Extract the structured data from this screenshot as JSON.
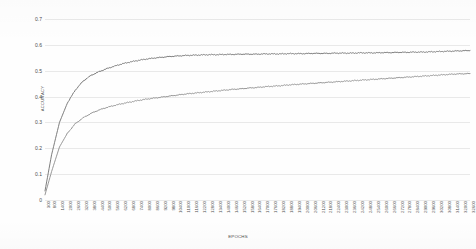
{
  "chart_data": {
    "type": "line",
    "title": "",
    "xlabel": "EPOCHS",
    "ylabel": "ACCURACY",
    "ylim": [
      0,
      0.7
    ],
    "yticks": [
      0,
      0.1,
      0.2,
      0.3,
      0.4,
      0.5,
      0.6,
      0.7
    ],
    "ytick_labels": [
      "0",
      "0.1",
      "0.2",
      "0.3",
      "0.4",
      "0.5",
      "0.6",
      "0.7"
    ],
    "grid": true,
    "legend": "none",
    "x": [
      300,
      800,
      1400,
      2000,
      2600,
      3200,
      3800,
      4400,
      5000,
      5600,
      6200,
      6800,
      7400,
      8000,
      8600,
      9200,
      9800,
      10400,
      11000,
      11600,
      12200,
      12800,
      13400,
      14000,
      14600,
      15200,
      15800,
      16400,
      17000,
      17600,
      18200,
      18800,
      19400,
      20000,
      20600,
      21200,
      21800,
      22400,
      23000,
      23600,
      24200,
      24800,
      25400,
      26000,
      26600,
      27200,
      27800,
      28400,
      29000,
      29600,
      30200,
      30800,
      31400,
      32000,
      32600
    ],
    "xtick_labels": [
      "300",
      "800",
      "1400",
      "2000",
      "2600",
      "3200",
      "3800",
      "4400",
      "5000",
      "5600",
      "6200",
      "6800",
      "7400",
      "8000",
      "8600",
      "9200",
      "9800",
      "10400",
      "11000",
      "11600",
      "12200",
      "12800",
      "13400",
      "14000",
      "14600",
      "15200",
      "15800",
      "16400",
      "17000",
      "17600",
      "18200",
      "18800",
      "19400",
      "20000",
      "20600",
      "21200",
      "21800",
      "22400",
      "23000",
      "23600",
      "24200",
      "24800",
      "25400",
      "26000",
      "26600",
      "27200",
      "27800",
      "28400",
      "29000",
      "29600",
      "30200",
      "30800",
      "31400",
      "32000",
      "32600"
    ],
    "series": [
      {
        "name": "upper-curve",
        "color": "#6e6e6e",
        "values": [
          0.035,
          0.175,
          0.3,
          0.375,
          0.425,
          0.46,
          0.482,
          0.496,
          0.508,
          0.518,
          0.527,
          0.534,
          0.54,
          0.545,
          0.549,
          0.552,
          0.555,
          0.557,
          0.559,
          0.56,
          0.561,
          0.562,
          0.562,
          0.563,
          0.563,
          0.564,
          0.564,
          0.564,
          0.565,
          0.565,
          0.565,
          0.566,
          0.566,
          0.566,
          0.567,
          0.567,
          0.567,
          0.568,
          0.568,
          0.568,
          0.569,
          0.569,
          0.569,
          0.57,
          0.57,
          0.571,
          0.571,
          0.572,
          0.572,
          0.573,
          0.574,
          0.575,
          0.576,
          0.577,
          0.578
        ]
      },
      {
        "name": "lower-curve",
        "color": "#8b8b8b",
        "values": [
          0.02,
          0.11,
          0.205,
          0.258,
          0.295,
          0.318,
          0.335,
          0.348,
          0.358,
          0.366,
          0.373,
          0.379,
          0.385,
          0.39,
          0.394,
          0.398,
          0.402,
          0.406,
          0.41,
          0.413,
          0.416,
          0.419,
          0.422,
          0.425,
          0.428,
          0.43,
          0.433,
          0.435,
          0.438,
          0.44,
          0.442,
          0.445,
          0.447,
          0.449,
          0.451,
          0.453,
          0.455,
          0.457,
          0.459,
          0.461,
          0.463,
          0.465,
          0.467,
          0.469,
          0.471,
          0.473,
          0.475,
          0.477,
          0.479,
          0.481,
          0.483,
          0.485,
          0.487,
          0.488,
          0.489
        ]
      }
    ]
  }
}
